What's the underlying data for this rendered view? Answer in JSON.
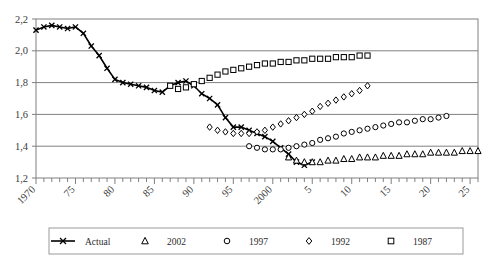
{
  "chart_data": {
    "type": "line",
    "title": "",
    "xlabel": "",
    "ylabel": "",
    "xlim": [
      1970,
      2026
    ],
    "ylim": [
      1.2,
      2.2
    ],
    "grid": true,
    "y_ticks": [
      "2,2",
      "2,0",
      "1,8",
      "1,6",
      "1,4",
      "1,2"
    ],
    "y_tick_values": [
      2.2,
      2.0,
      1.8,
      1.6,
      1.4,
      1.2
    ],
    "x_ticks": [
      "1970",
      "75",
      "80",
      "85",
      "90",
      "95",
      "2000",
      "5",
      "10",
      "15",
      "20",
      "25"
    ],
    "x_tick_values": [
      1970,
      1975,
      1980,
      1985,
      1990,
      1995,
      2000,
      2005,
      2010,
      2015,
      2020,
      2025
    ],
    "legend_position": "bottom",
    "series": [
      {
        "name": "Actual",
        "marker": "cross",
        "line": true,
        "x": [
          1970,
          1971,
          1972,
          1973,
          1974,
          1975,
          1976,
          1977,
          1978,
          1979,
          1980,
          1981,
          1982,
          1983,
          1984,
          1985,
          1986,
          1987,
          1988,
          1989,
          1990,
          1991,
          1992,
          1993,
          1994,
          1995,
          1996,
          1997,
          1998,
          1999,
          2000,
          2001,
          2002,
          2003,
          2004,
          2005
        ],
        "values": [
          2.13,
          2.15,
          2.16,
          2.15,
          2.14,
          2.15,
          2.11,
          2.03,
          1.97,
          1.89,
          1.82,
          1.8,
          1.79,
          1.78,
          1.77,
          1.75,
          1.74,
          1.78,
          1.8,
          1.81,
          1.78,
          1.73,
          1.7,
          1.66,
          1.58,
          1.52,
          1.52,
          1.5,
          1.48,
          1.46,
          1.43,
          1.39,
          1.35,
          1.3,
          1.28,
          1.3
        ]
      },
      {
        "name": "2002",
        "marker": "triangle",
        "line": false,
        "x": [
          2002,
          2003,
          2004,
          2005,
          2006,
          2007,
          2008,
          2009,
          2010,
          2011,
          2012,
          2013,
          2014,
          2015,
          2016,
          2017,
          2018,
          2019,
          2020,
          2021,
          2022,
          2023,
          2024,
          2025,
          2026
        ],
        "values": [
          1.33,
          1.31,
          1.3,
          1.3,
          1.3,
          1.31,
          1.31,
          1.32,
          1.32,
          1.33,
          1.33,
          1.33,
          1.34,
          1.34,
          1.34,
          1.35,
          1.35,
          1.35,
          1.36,
          1.36,
          1.36,
          1.36,
          1.37,
          1.37,
          1.37
        ]
      },
      {
        "name": "1997",
        "marker": "circle",
        "line": false,
        "x": [
          1997,
          1998,
          1999,
          2000,
          2001,
          2002,
          2003,
          2004,
          2005,
          2006,
          2007,
          2008,
          2009,
          2010,
          2011,
          2012,
          2013,
          2014,
          2015,
          2016,
          2017,
          2018,
          2019,
          2020,
          2021,
          2022
        ],
        "values": [
          1.4,
          1.39,
          1.38,
          1.38,
          1.38,
          1.39,
          1.4,
          1.41,
          1.42,
          1.44,
          1.45,
          1.46,
          1.48,
          1.49,
          1.5,
          1.51,
          1.52,
          1.53,
          1.54,
          1.55,
          1.55,
          1.56,
          1.57,
          1.57,
          1.58,
          1.59
        ]
      },
      {
        "name": "1992",
        "marker": "diamond",
        "line": false,
        "x": [
          1992,
          1993,
          1994,
          1995,
          1996,
          1997,
          1998,
          1999,
          2000,
          2001,
          2002,
          2003,
          2004,
          2005,
          2006,
          2007,
          2008,
          2009,
          2010,
          2011,
          2012
        ],
        "values": [
          1.52,
          1.5,
          1.49,
          1.48,
          1.48,
          1.48,
          1.49,
          1.5,
          1.52,
          1.54,
          1.56,
          1.58,
          1.6,
          1.62,
          1.65,
          1.67,
          1.69,
          1.71,
          1.73,
          1.75,
          1.78
        ]
      },
      {
        "name": "1987",
        "marker": "square",
        "line": false,
        "x": [
          1987,
          1988,
          1989,
          1990,
          1991,
          1992,
          1993,
          1994,
          1995,
          1996,
          1997,
          1998,
          1999,
          2000,
          2001,
          2002,
          2003,
          2004,
          2005,
          2006,
          2007,
          2008,
          2009,
          2010,
          2011,
          2012
        ],
        "values": [
          1.78,
          1.76,
          1.77,
          1.79,
          1.81,
          1.83,
          1.85,
          1.87,
          1.88,
          1.89,
          1.9,
          1.91,
          1.92,
          1.92,
          1.93,
          1.93,
          1.94,
          1.94,
          1.95,
          1.95,
          1.95,
          1.96,
          1.96,
          1.96,
          1.97,
          1.97
        ]
      }
    ]
  },
  "legend": {
    "items": [
      {
        "label": "Actual",
        "marker": "cross-line"
      },
      {
        "label": "2002",
        "marker": "triangle"
      },
      {
        "label": "1997",
        "marker": "circle"
      },
      {
        "label": "1992",
        "marker": "diamond"
      },
      {
        "label": "1987",
        "marker": "square"
      }
    ]
  },
  "colors": {
    "line": "#000000",
    "grid": "#808080",
    "axis": "#808080",
    "text": "#2b2b2b",
    "background": "#ffffff"
  }
}
